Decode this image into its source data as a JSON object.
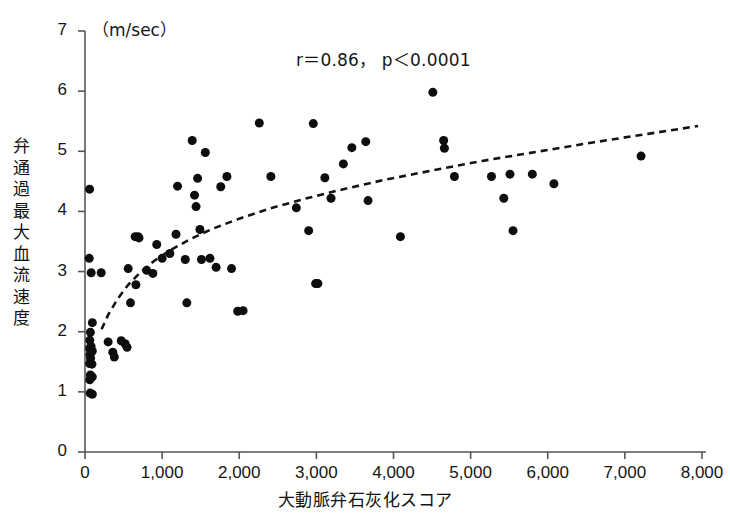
{
  "chart_data": {
    "type": "scatter",
    "title": "",
    "subtitle": "",
    "unit_label": "（m/sec）",
    "annotation": "r＝0.86，  p＜0.0001",
    "correlation_r": 0.86,
    "p_value": "<0.0001",
    "xlabel": "大動脈弁石灰化スコア",
    "ylabel": "弁通過最大血流速度",
    "xlim": [
      0,
      8000
    ],
    "ylim": [
      0,
      7
    ],
    "grid": false,
    "legend": null,
    "x_ticks": [
      0,
      1000,
      2000,
      3000,
      4000,
      5000,
      6000,
      7000,
      8000
    ],
    "x_tick_labels": [
      "0",
      "1,000",
      "2,000",
      "3,000",
      "4,000",
      "5,000",
      "6,000",
      "7,000",
      "8,000"
    ],
    "y_ticks": [
      0,
      1,
      2,
      3,
      4,
      5,
      6,
      7
    ],
    "y_tick_labels": [
      "0",
      "1",
      "2",
      "3",
      "4",
      "5",
      "6",
      "7"
    ],
    "marker": {
      "shape": "circle",
      "color": "#0d0d0d",
      "size_px": 9
    },
    "points": [
      [
        60,
        4.37
      ],
      [
        55,
        3.22
      ],
      [
        80,
        2.98
      ],
      [
        95,
        2.15
      ],
      [
        70,
        1.99
      ],
      [
        62,
        1.86
      ],
      [
        78,
        1.76
      ],
      [
        60,
        1.72
      ],
      [
        95,
        1.68
      ],
      [
        66,
        1.62
      ],
      [
        72,
        1.56
      ],
      [
        60,
        1.47
      ],
      [
        90,
        1.46
      ],
      [
        70,
        1.28
      ],
      [
        95,
        1.25
      ],
      [
        62,
        1.2
      ],
      [
        66,
        0.98
      ],
      [
        95,
        0.96
      ],
      [
        210,
        2.98
      ],
      [
        300,
        1.83
      ],
      [
        360,
        1.66
      ],
      [
        380,
        1.58
      ],
      [
        470,
        1.85
      ],
      [
        520,
        1.8
      ],
      [
        545,
        1.74
      ],
      [
        560,
        3.05
      ],
      [
        590,
        2.48
      ],
      [
        650,
        3.58
      ],
      [
        660,
        2.78
      ],
      [
        690,
        3.58
      ],
      [
        700,
        3.56
      ],
      [
        800,
        3.02
      ],
      [
        880,
        2.97
      ],
      [
        930,
        3.45
      ],
      [
        1000,
        3.22
      ],
      [
        1100,
        3.3
      ],
      [
        1180,
        3.62
      ],
      [
        1200,
        4.42
      ],
      [
        1300,
        3.2
      ],
      [
        1320,
        2.48
      ],
      [
        1390,
        5.18
      ],
      [
        1420,
        4.27
      ],
      [
        1440,
        4.08
      ],
      [
        1460,
        4.55
      ],
      [
        1490,
        3.7
      ],
      [
        1510,
        3.2
      ],
      [
        1560,
        4.98
      ],
      [
        1620,
        3.22
      ],
      [
        1700,
        3.07
      ],
      [
        1760,
        4.41
      ],
      [
        1840,
        4.58
      ],
      [
        1900,
        3.05
      ],
      [
        1980,
        2.34
      ],
      [
        2050,
        2.35
      ],
      [
        2260,
        5.47
      ],
      [
        2410,
        4.58
      ],
      [
        2740,
        4.06
      ],
      [
        2900,
        3.68
      ],
      [
        2960,
        5.46
      ],
      [
        2990,
        2.8
      ],
      [
        3020,
        2.8
      ],
      [
        3110,
        4.56
      ],
      [
        3190,
        4.22
      ],
      [
        3350,
        4.79
      ],
      [
        3460,
        5.06
      ],
      [
        3640,
        5.16
      ],
      [
        3670,
        4.18
      ],
      [
        4090,
        3.58
      ],
      [
        4510,
        5.98
      ],
      [
        4650,
        5.18
      ],
      [
        4660,
        5.05
      ],
      [
        4790,
        4.58
      ],
      [
        5270,
        4.58
      ],
      [
        5430,
        4.22
      ],
      [
        5510,
        4.62
      ],
      [
        5550,
        3.68
      ],
      [
        5800,
        4.62
      ],
      [
        6080,
        4.46
      ],
      [
        7210,
        4.92
      ]
    ],
    "fit_curve": {
      "style": "dashed",
      "color": "#141414",
      "description": "logarithmic regression curve",
      "points": [
        [
          215,
          2.04
        ],
        [
          300,
          2.28
        ],
        [
          420,
          2.54
        ],
        [
          560,
          2.78
        ],
        [
          720,
          2.99
        ],
        [
          900,
          3.18
        ],
        [
          1100,
          3.35
        ],
        [
          1350,
          3.53
        ],
        [
          1650,
          3.71
        ],
        [
          2000,
          3.88
        ],
        [
          2400,
          4.05
        ],
        [
          2850,
          4.21
        ],
        [
          3350,
          4.37
        ],
        [
          3900,
          4.53
        ],
        [
          4500,
          4.68
        ],
        [
          5150,
          4.84
        ],
        [
          5850,
          4.99
        ],
        [
          6600,
          5.15
        ],
        [
          7300,
          5.29
        ],
        [
          7950,
          5.42
        ]
      ]
    }
  },
  "axes": {
    "x_axis_name": "horizontal-axis",
    "y_axis_name": "vertical-axis"
  }
}
